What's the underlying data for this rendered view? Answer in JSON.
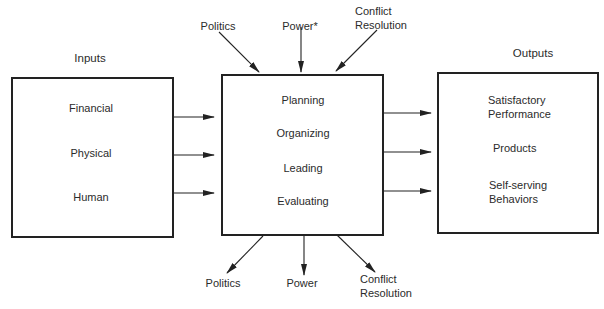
{
  "diagram": {
    "inputs": {
      "title": "Inputs",
      "items": [
        "Financial",
        "Physical",
        "Human"
      ]
    },
    "process": {
      "items": [
        "Planning",
        "Organizing",
        "Leading",
        "Evaluating"
      ]
    },
    "outputs": {
      "title": "Outputs",
      "items": [
        {
          "line1": "Satisfactory",
          "line2": "Performance"
        },
        {
          "line1": "Products",
          "line2": ""
        },
        {
          "line1": "Self-serving",
          "line2": "Behaviors"
        }
      ]
    },
    "top_influences": {
      "politics": "Politics",
      "power": "Power*",
      "conflict_line1": "Conflict",
      "conflict_line2": "Resolution"
    },
    "bottom_influences": {
      "politics": "Politics",
      "power": "Power",
      "conflict_line1": "Conflict",
      "conflict_line2": "Resolution"
    },
    "colors": {
      "line": "#222222",
      "text": "#2b2b2b",
      "background": "#ffffff"
    }
  }
}
